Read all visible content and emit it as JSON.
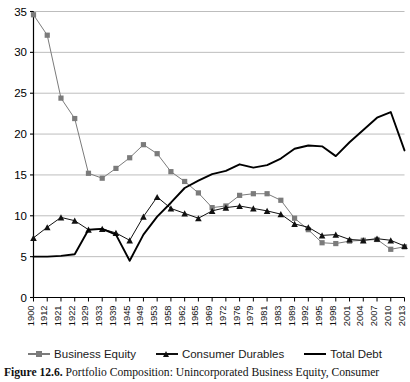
{
  "figure": {
    "caption_label": "Figure 12.6.",
    "caption_text": " Portfolio Composition: Unincorporated Business Equity, Consumer"
  },
  "legend": {
    "position": "bottom-center",
    "entries": [
      {
        "label": "Business Equity",
        "marker": "square",
        "color": "#7b7b7b",
        "icon": "legend-square-marker-icon"
      },
      {
        "label": "Consumer Durables",
        "marker": "triangle",
        "color": "#111111",
        "icon": "legend-triangle-marker-icon"
      },
      {
        "label": "Total Debt",
        "marker": "line",
        "color": "#000000",
        "icon": "legend-line-marker-icon"
      }
    ]
  },
  "chart_data": {
    "type": "line",
    "title": "",
    "subtitle": "",
    "xlabel": "",
    "ylabel": "",
    "grid": true,
    "grid_axis": "y",
    "legend_position": "bottom",
    "xlim_categorical": true,
    "ylim": [
      0,
      35
    ],
    "ytick_step": 5,
    "yticks": [
      0,
      5,
      10,
      15,
      20,
      25,
      30,
      35
    ],
    "ytick_labels": [
      "0",
      "5",
      "10",
      "15",
      "20",
      "25",
      "30",
      "35"
    ],
    "categories": [
      "1900",
      "1912",
      "1921",
      "1922",
      "1929",
      "1933",
      "1939",
      "1945",
      "1949",
      "1953",
      "1958",
      "1962",
      "1965",
      "1969",
      "1972",
      "1976",
      "1979",
      "1981",
      "1983",
      "1989",
      "1992",
      "1995",
      "1998",
      "2001",
      "2004",
      "2007",
      "2010",
      "2013"
    ],
    "series": [
      {
        "name": "Business Equity",
        "marker": "square",
        "color": "#7b7b7b",
        "values": [
          34.6,
          32.1,
          24.4,
          21.9,
          15.2,
          14.6,
          15.8,
          17.1,
          18.7,
          17.6,
          15.4,
          14.2,
          12.8,
          11.0,
          11.2,
          12.5,
          12.7,
          12.7,
          11.9,
          9.7,
          8.3,
          6.7,
          6.6,
          6.9,
          7.0,
          7.1,
          5.9,
          6.2
        ]
      },
      {
        "name": "Consumer Durables",
        "marker": "triangle",
        "color": "#111111",
        "values": [
          7.3,
          8.6,
          9.8,
          9.4,
          8.3,
          8.4,
          7.9,
          7.0,
          9.9,
          12.3,
          10.9,
          10.3,
          9.7,
          10.6,
          11.0,
          11.2,
          10.9,
          10.6,
          10.2,
          9.0,
          8.6,
          7.6,
          7.7,
          7.1,
          7.0,
          7.2,
          7.0,
          6.3
        ]
      },
      {
        "name": "Total Debt",
        "marker": "none",
        "color": "#000000",
        "values": [
          5.0,
          5.0,
          5.1,
          5.3,
          8.3,
          8.4,
          7.7,
          4.5,
          7.7,
          9.9,
          11.6,
          13.4,
          14.3,
          15.1,
          15.5,
          16.3,
          15.9,
          16.2,
          17.0,
          18.2,
          18.6,
          18.5,
          17.3,
          19.0,
          20.5,
          22.0,
          22.7,
          18.0
        ]
      }
    ]
  }
}
